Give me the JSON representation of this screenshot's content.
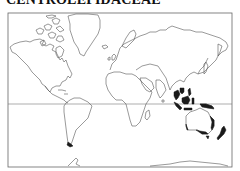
{
  "map": {
    "title": "CENTROLEPIDACEAE",
    "projection": "world-mercator",
    "frame": {
      "left": 8,
      "top": 13,
      "right": 232,
      "bottom": 167
    },
    "equator_y": 104,
    "colors": {
      "outline": "#555555",
      "frame": "#666666",
      "distribution": "#1a1a1a",
      "background": "#ffffff"
    },
    "distribution_regions": [
      "Southeast Asia (Indochina / South China)",
      "Malesia (Borneo, Sumatra, Java, Philippines, New Guinea)",
      "Australia (eastern, southern and southwestern coasts, Tasmania)",
      "New Zealand",
      "Southern South America (Tierra del Fuego / southern Chile)"
    ]
  }
}
